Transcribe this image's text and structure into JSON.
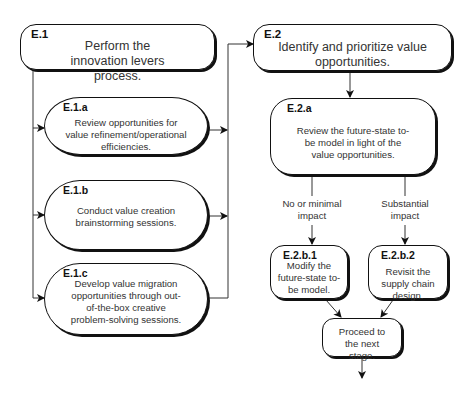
{
  "diagram": {
    "nodes": {
      "e1": {
        "id": "E.1",
        "text": "Perform the innovation levers process."
      },
      "e1a": {
        "id": "E.1.a",
        "text": "Review opportunities for value refinement/operational efficiencies."
      },
      "e1b": {
        "id": "E.1.b",
        "text": "Conduct value creation brainstorming sessions."
      },
      "e1c": {
        "id": "E.1.c",
        "text": "Develop value migration opportunities through out-of-the-box creative problem-solving sessions."
      },
      "e2": {
        "id": "E.2",
        "text": "Identify and prioritize value opportunities."
      },
      "e2a": {
        "id": "E.2.a",
        "text": "Review the future-state to-be model in light of the value opportunities."
      },
      "e2b1": {
        "id": "E.2.b.1",
        "text": "Modify the future-state to-be model."
      },
      "e2b2": {
        "id": "E.2.b.2",
        "text": "Revisit the supply chain design."
      },
      "next": {
        "id": "",
        "text": "Proceed to the next stage."
      }
    },
    "edge_labels": {
      "no_impact": "No or minimal impact",
      "substantial": "Substantial impact"
    },
    "edges": [
      [
        "E.1",
        "E.1.a"
      ],
      [
        "E.1",
        "E.1.b"
      ],
      [
        "E.1",
        "E.1.c"
      ],
      [
        "E.1.a",
        "E.2"
      ],
      [
        "E.1.b",
        "E.2"
      ],
      [
        "E.1.c",
        "E.2"
      ],
      [
        "E.2",
        "E.2.a"
      ],
      [
        "E.2.a",
        "E.2.b.1",
        "No or minimal impact"
      ],
      [
        "E.2.a",
        "E.2.b.2",
        "Substantial impact"
      ],
      [
        "E.2.b.1",
        "Proceed to the next stage."
      ],
      [
        "E.2.b.2",
        "Proceed to the next stage."
      ]
    ]
  }
}
